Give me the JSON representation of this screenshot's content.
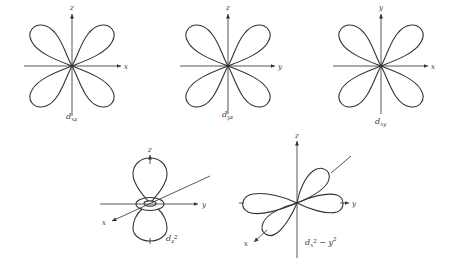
{
  "diagrams": [
    {
      "id": "dxz",
      "caption_main": "d",
      "caption_sub": "xz",
      "axis_h": "x",
      "axis_v": "z"
    },
    {
      "id": "dyz",
      "caption_main": "d",
      "caption_sub": "yz",
      "axis_h": "y",
      "axis_v": "z"
    },
    {
      "id": "dxy",
      "caption_main": "d",
      "caption_sub": "xy",
      "axis_h": "x",
      "axis_v": "y"
    },
    {
      "id": "dz2",
      "caption_main": "d",
      "caption_sub": "z",
      "caption_sup": "2",
      "axis_h": "y",
      "axis_v": "z",
      "axis_d": "x"
    },
    {
      "id": "dx2-y2",
      "caption_main": "d",
      "caption_sub": "x",
      "caption_sup": "2",
      "caption_tail": " − y",
      "caption_tail_sup": "2",
      "axis_h": "y",
      "axis_v": "z",
      "axis_d": "x"
    }
  ],
  "colors": {
    "line": "#333333",
    "background": "#ffffff"
  }
}
